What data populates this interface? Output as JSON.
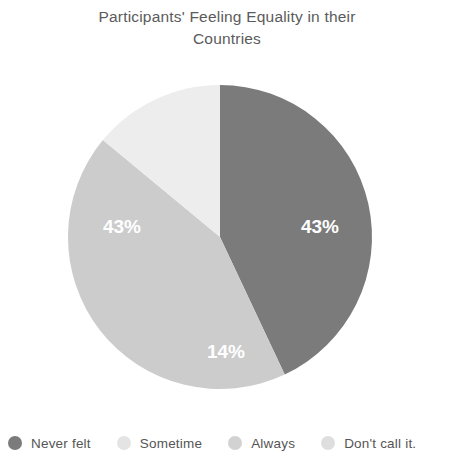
{
  "chart_data": {
    "type": "pie",
    "title": "Participants' Feeling Equality in their\nCountries",
    "title_line1": "Participants' Feeling Equality in their",
    "title_line2": "Countries",
    "categories": [
      "Never felt",
      "Sometime",
      "Always",
      "Don't call it."
    ],
    "values": [
      43,
      43,
      14,
      0
    ],
    "value_labels": [
      "43%",
      "43%",
      "14%",
      ""
    ],
    "colors": [
      "#7b7b7b",
      "#cccccc",
      "#ededed",
      "#dedede"
    ],
    "legend_position": "bottom",
    "grid": false,
    "xlabel": "",
    "ylabel": "",
    "visible_slice_labels": [
      {
        "text": "43%",
        "x": 320,
        "y": 168
      },
      {
        "text": "43%",
        "x": 122,
        "y": 168
      },
      {
        "text": "14%",
        "x": 226,
        "y": 293
      }
    ],
    "geometry": {
      "cx": 220,
      "cy": 177,
      "r": 152,
      "start_angle_deg": 0
    }
  },
  "legend": {
    "items": [
      {
        "label": "Never felt",
        "color": "#7b7b7b"
      },
      {
        "label": "Sometime",
        "color": "#e4e4e4"
      },
      {
        "label": "Always",
        "color": "#d2d2d2"
      },
      {
        "label": "Don't call it.",
        "color": "#dedede"
      }
    ]
  },
  "theme": {
    "background": "#ffffff",
    "title_color": "#5b5b5b",
    "label_color": "#ffffff",
    "legend_text_color": "#555555"
  }
}
